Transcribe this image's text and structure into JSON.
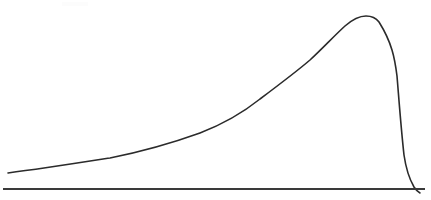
{
  "figure": {
    "title": "",
    "width": 431,
    "height": 200,
    "background_color": "#ffffff",
    "has_axes_labels": false,
    "has_tick_marks": false,
    "has_legend": false,
    "has_gridlines": false,
    "style_note": "scanned line drawing, hand-drawn appearance"
  },
  "axis": {
    "baseline_color": "#3a3a3a",
    "baseline_width": 2,
    "baseline_x_start": 3,
    "baseline_x_end": 425,
    "baseline_y": 189,
    "tick_labels": [],
    "axis_label": ""
  },
  "curve": {
    "name": "skewed-distribution-curve",
    "stroke_color": "#2b2b2b",
    "stroke_width": 1.6,
    "path": "M 8 173 C 40 169, 78 163, 110 158 C 145 151, 175 142, 200 133 C 226 123, 245 111, 260 99 C 280 84, 296 72, 310 60 C 324 47, 334 36, 345 26 C 353 19, 360 16, 366 16 C 372 16, 376 18, 379 22 C 384 30, 389 40, 392 50 C 395 60, 396 68, 397 76 C 399 100, 401 128, 404 155 C 406 169, 410 180, 414 187 C 416 190, 418 192, 420 193"
  },
  "chart_data": {
    "type": "line",
    "title": "",
    "subtitle": "",
    "xlabel": "",
    "ylabel": "",
    "legend": [],
    "legend_position": "none",
    "grid": false,
    "xlim": [
      0,
      431
    ],
    "ylim": [
      0,
      200
    ],
    "axis_orientation": "y-inverted-pixel-coords",
    "series": [
      {
        "name": "curve",
        "points_pixel": [
          [
            8,
            173
          ],
          [
            40,
            169
          ],
          [
            60,
            166
          ],
          [
            80,
            163
          ],
          [
            110,
            158
          ],
          [
            140,
            152
          ],
          [
            170,
            144
          ],
          [
            200,
            133
          ],
          [
            230,
            117
          ],
          [
            260,
            99
          ],
          [
            285,
            79
          ],
          [
            310,
            60
          ],
          [
            330,
            43
          ],
          [
            345,
            27
          ],
          [
            355,
            19
          ],
          [
            366,
            16
          ],
          [
            374,
            17
          ],
          [
            379,
            22
          ],
          [
            386,
            35
          ],
          [
            392,
            50
          ],
          [
            396,
            68
          ],
          [
            398,
            88
          ],
          [
            400,
            110
          ],
          [
            402,
            132
          ],
          [
            404,
            155
          ],
          [
            409,
            174
          ],
          [
            414,
            187
          ],
          [
            420,
            193
          ]
        ],
        "normalized_x": [
          0.0,
          0.08,
          0.13,
          0.17,
          0.25,
          0.32,
          0.39,
          0.47,
          0.54,
          0.61,
          0.67,
          0.73,
          0.78,
          0.82,
          0.84,
          0.87,
          0.89,
          0.9,
          0.92,
          0.93,
          0.94,
          0.95,
          0.95,
          0.96,
          0.96,
          0.97,
          0.98,
          1.0
        ],
        "normalized_y": [
          0.09,
          0.12,
          0.13,
          0.15,
          0.18,
          0.21,
          0.26,
          0.32,
          0.42,
          0.52,
          0.64,
          0.75,
          0.84,
          0.94,
          0.98,
          1.0,
          0.99,
          0.96,
          0.89,
          0.8,
          0.7,
          0.58,
          0.46,
          0.33,
          0.2,
          0.09,
          0.01,
          0.0
        ]
      }
    ],
    "annotations": [],
    "peak": {
      "x_pixel": 366,
      "y_pixel": 16,
      "normalized_x": 0.87,
      "normalized_y": 1.0
    },
    "start_point_pixel": [
      8,
      173
    ],
    "end_point_pixel": [
      420,
      193
    ]
  }
}
